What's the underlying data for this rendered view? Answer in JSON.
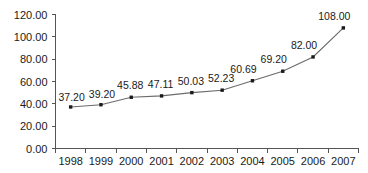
{
  "chart_data": {
    "type": "line",
    "title": "",
    "subtitle": "",
    "xlabel": "",
    "ylabel": "",
    "categories": [
      "1998",
      "1999",
      "2000",
      "2001",
      "2002",
      "2003",
      "2004",
      "2005",
      "2006",
      "2007"
    ],
    "values": [
      37.2,
      39.2,
      45.88,
      47.11,
      50.03,
      52.23,
      60.69,
      69.2,
      82.0,
      108.0
    ],
    "point_labels": [
      "37.20",
      "39.20",
      "45.88",
      "47.11",
      "50.03",
      "52.23",
      "60.69",
      "69.20",
      "82.00",
      "108.00"
    ],
    "ylim": [
      0,
      120
    ],
    "yticks": [
      0,
      20,
      40,
      60,
      80,
      100,
      120
    ],
    "ytick_labels": [
      "0.00",
      "20.00",
      "40.00",
      "60.00",
      "80.00",
      "100.00",
      "120.00"
    ],
    "xtick_labels": [
      "1998",
      "1999",
      "2000",
      "2001",
      "2002",
      "2003",
      "2004",
      "2005",
      "2006",
      "2007"
    ],
    "grid": false,
    "legend": false,
    "legend_position": "none",
    "series": [
      {
        "name": "",
        "values": [
          37.2,
          39.2,
          45.88,
          47.11,
          50.03,
          52.23,
          60.69,
          69.2,
          82.0,
          108.0
        ]
      }
    ],
    "colors": {
      "line": "#6b6b6b",
      "marker": "#1a1a1a",
      "axis": "#555555",
      "text": "#1a1a1a",
      "background": "#ffffff"
    }
  }
}
